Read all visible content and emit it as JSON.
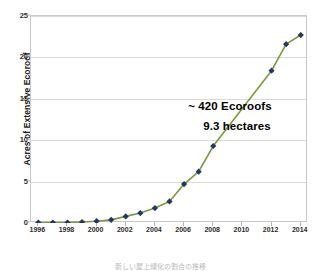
{
  "chart_data": {
    "type": "line",
    "title": "",
    "xlabel": "",
    "ylabel": "Acres of Extensive Ecoroof",
    "xlim": [
      1995.5,
      2014.5
    ],
    "ylim": [
      0,
      25
    ],
    "grid": true,
    "legend": "none",
    "x": [
      1996,
      1997,
      1998,
      1999,
      2000,
      2001,
      2002,
      2003,
      2004,
      2005,
      2006,
      2007,
      2008,
      2012,
      2013,
      2014
    ],
    "values": [
      0.05,
      0.05,
      0.05,
      0.12,
      0.22,
      0.38,
      0.8,
      1.2,
      1.8,
      2.6,
      4.7,
      6.2,
      9.3,
      18.4,
      21.6,
      22.7
    ],
    "series": [
      {
        "name": "Acres of Extensive Ecoroof",
        "values": [
          0.05,
          0.05,
          0.05,
          0.12,
          0.22,
          0.38,
          0.8,
          1.2,
          1.8,
          2.6,
          4.7,
          6.2,
          9.3,
          18.4,
          21.6,
          22.7
        ]
      }
    ],
    "y_ticks": [
      0,
      5,
      10,
      15,
      20,
      25
    ],
    "x_ticks": [
      1996,
      1998,
      2000,
      2002,
      2004,
      2006,
      2008,
      2010,
      2012,
      2014
    ],
    "annotations": [
      {
        "text": "~ 420 Ecoroofs"
      },
      {
        "text": "9.3 hectares"
      }
    ],
    "colors": {
      "line": "#7C9A3C",
      "marker": "#1F3864",
      "gridline": "#D9D9D9",
      "plot_border": "#C8C8C8",
      "background": "#FFFFFF",
      "text": "#1A1A1A"
    }
  },
  "caption": {
    "bottom_text": "新しい屋上緑化の割合の推移"
  }
}
